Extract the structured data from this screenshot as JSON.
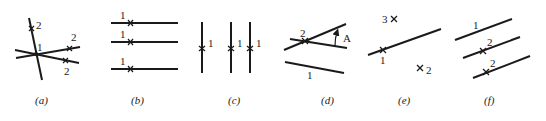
{
  "figure": {
    "panels": [
      {
        "id": "a",
        "caption": "(a)",
        "labels": {
          "center": "1",
          "top": "2",
          "right_upper": "2",
          "right_lower": "2"
        }
      },
      {
        "id": "b",
        "caption": "(b)",
        "labels": {
          "line1": "1",
          "line2": "1",
          "line3": "1"
        }
      },
      {
        "id": "c",
        "caption": "(c)",
        "labels": {
          "line1": "1",
          "line2": "1",
          "line3": "1"
        }
      },
      {
        "id": "d",
        "caption": "(d)",
        "labels": {
          "intersection": "2",
          "angle": "A",
          "lower_line": "1"
        }
      },
      {
        "id": "e",
        "caption": "(e)",
        "labels": {
          "point3": "3",
          "point1": "1",
          "point2": "2"
        }
      },
      {
        "id": "f",
        "caption": "(f)",
        "labels": {
          "line1": "1",
          "line2": "2",
          "line3": "2"
        }
      }
    ]
  }
}
